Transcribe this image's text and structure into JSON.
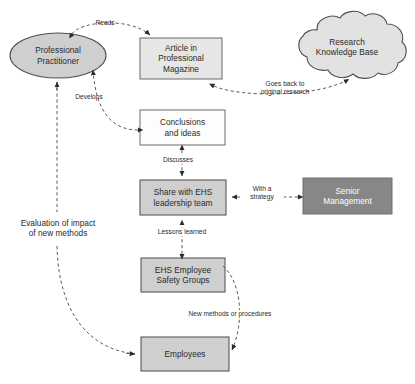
{
  "diagram": {
    "colors": {
      "node_gray_fill": "#cfcfcf",
      "node_dark_fill": "#878787",
      "node_white_fill": "#fdfdfd",
      "stroke": "#5a5a5a",
      "text": "#2b2b2b",
      "text_light": "#ffffff",
      "background": "#ffffff"
    },
    "nodes": [
      {
        "id": "professional-practitioner",
        "label": "Professional\nPractitioner",
        "shape": "ellipse",
        "fill": "#cfcfcf",
        "x": 10,
        "y": 33,
        "w": 96,
        "h": 45
      },
      {
        "id": "article-in-professional-magazine",
        "label": "Article in\nProfessional\nMagazine",
        "shape": "rectangle",
        "fill": "#e4e4e4",
        "x": 140,
        "y": 38,
        "w": 82,
        "h": 41
      },
      {
        "id": "research-knowledge-base",
        "label": "Research\nKnowledge Base",
        "shape": "cloud",
        "fill": "#e0e0e0",
        "x": 287,
        "y": 16,
        "w": 119,
        "h": 62
      },
      {
        "id": "conclusions-and-ideas",
        "label": "Conclusions\nand ideas",
        "shape": "rectangle",
        "fill": "#fdfdfd",
        "x": 140,
        "y": 110,
        "w": 85,
        "h": 35
      },
      {
        "id": "share-with-ehs-leadership-team",
        "label": "Share with EHS\nleadership team",
        "shape": "rectangle",
        "fill": "#cfcfcf",
        "x": 140,
        "y": 180,
        "w": 86,
        "h": 35
      },
      {
        "id": "senior-management",
        "label": "Senior\nManagement",
        "shape": "rectangle",
        "fill": "#878787",
        "x": 303,
        "y": 178,
        "w": 89,
        "h": 36
      },
      {
        "id": "ehs-employee-safety-groups",
        "label": "EHS Employee\nSafety Groups",
        "shape": "rectangle",
        "fill": "#cfcfcf",
        "x": 141,
        "y": 258,
        "w": 84,
        "h": 34
      },
      {
        "id": "employees",
        "label": "Employees",
        "shape": "rectangle",
        "fill": "#cfcfcf",
        "x": 141,
        "y": 337,
        "w": 88,
        "h": 34
      }
    ],
    "edges": [
      {
        "id": "reads",
        "label": "Reads",
        "from": "professional-practitioner",
        "to": "article-in-professional-magazine",
        "style": "dashed",
        "arrows": "both",
        "label_x": 100,
        "label_y": 23
      },
      {
        "id": "goes-back-to-original-research",
        "label": "Goes back to\noriginal research",
        "from": "article-in-professional-magazine",
        "to": "research-knowledge-base",
        "style": "dashed",
        "arrows": "both",
        "label_x": 252,
        "label_y": 82
      },
      {
        "id": "develops",
        "label": "Develops",
        "from": "conclusions-and-ideas",
        "to": "professional-practitioner",
        "style": "dashed",
        "arrows": "both",
        "label_x": 80,
        "label_y": 96
      },
      {
        "id": "discusses",
        "label": "Discusses",
        "from": "conclusions-and-ideas",
        "to": "share-with-ehs-leadership-team",
        "style": "dashed",
        "arrows": "both",
        "label_x": 160,
        "label_y": 159
      },
      {
        "id": "with-a-strategy",
        "label": "With a\nstrategy",
        "from": "senior-management",
        "to": "share-with-ehs-leadership-team",
        "style": "dashed",
        "arrows": "both",
        "label_x": 249,
        "label_y": 188
      },
      {
        "id": "lessons-learned",
        "label": "Lessons learned",
        "from": "ehs-employee-safety-groups",
        "to": "share-with-ehs-leadership-team",
        "style": "dashed",
        "arrows": "both",
        "label_x": 152,
        "label_y": 231
      },
      {
        "id": "new-methods-or-procedures",
        "label": "New methods or procedures",
        "from": "ehs-employee-safety-groups",
        "to": "employees",
        "style": "dashed",
        "arrows": "end",
        "label_x": 178,
        "label_y": 313
      },
      {
        "id": "evaluation-of-impact-of-new-methods",
        "label": "Evaluation of impact\nof new methods",
        "from": "employees",
        "to": "professional-practitioner",
        "style": "dashed",
        "arrows": "end",
        "label_x": 12,
        "label_y": 222
      }
    ]
  }
}
